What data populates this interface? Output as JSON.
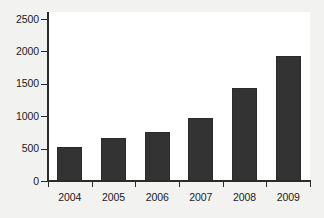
{
  "chart_data": {
    "type": "bar",
    "title": "",
    "subtitle": "",
    "xlabel": "",
    "ylabel": "",
    "categories": [
      "2004",
      "2005",
      "2006",
      "2007",
      "2008",
      "2009"
    ],
    "values": [
      520,
      660,
      760,
      975,
      1440,
      1930
    ],
    "series": [
      {
        "name": "",
        "values": [
          520,
          660,
          760,
          975,
          1440,
          1930
        ]
      }
    ],
    "ylim": [
      0,
      2500
    ],
    "yticks": [
      0,
      500,
      1000,
      1500,
      2000,
      2500
    ],
    "ytick_labels": [
      "0",
      "500",
      "1000",
      "1500",
      "2000",
      "2500"
    ],
    "grid": false,
    "legend": false,
    "legend_position": "none",
    "bar_color": "#333333",
    "plot_background": "#ffffff",
    "figure_background": "#f2f2f0",
    "axis_color": "#2b2b2b"
  }
}
